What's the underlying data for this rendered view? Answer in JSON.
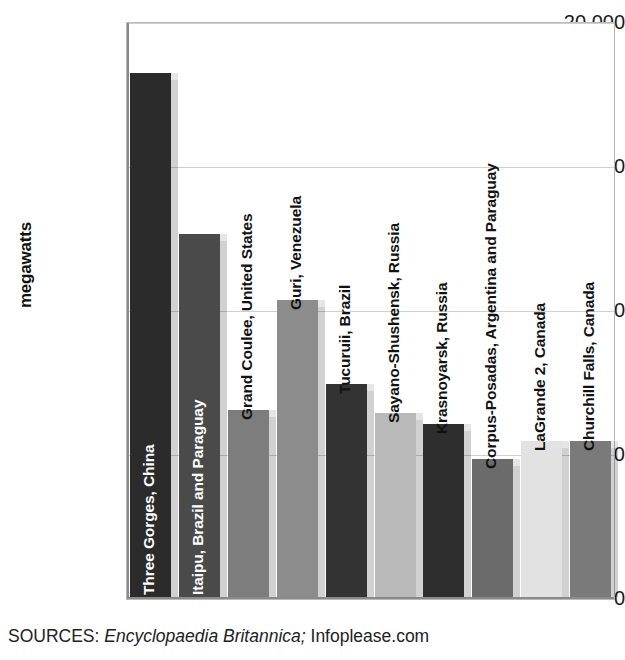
{
  "chart_data": {
    "type": "bar",
    "title": "",
    "xlabel": "",
    "ylabel": "megawatts",
    "ylim": [
      0,
      20000
    ],
    "yticks": [
      0,
      5000,
      10000,
      15000,
      20000
    ],
    "ytick_labels": [
      "0",
      "5,000",
      "10,000",
      "15,000",
      "20,000"
    ],
    "grid": true,
    "legend": "none",
    "categories": [
      "Three Gorges, China",
      "Itaipu, Brazil and Paraguay",
      "Grand Coulee, United States",
      "Guri, Venezuela",
      "Tucuruii, Brazil",
      "Sayano-Shushensk, Russia",
      "Krasnoyarsk, Russia",
      "Corpus-Posadas, Argentina and Paraguay",
      "LaGrande 2, Canada",
      "Churchill Falls, Canada"
    ],
    "values": [
      18200,
      12600,
      6500,
      10300,
      7400,
      6400,
      6000,
      4800,
      5400,
      5400
    ],
    "bar_colors": [
      "#2b2b2b",
      "#4a4a4a",
      "#7d7d7d",
      "#8c8c8c",
      "#333333",
      "#b9b9b9",
      "#2e2e2e",
      "#6b6b6b",
      "#e2e2e2",
      "#7a7a7a"
    ],
    "label_colors": [
      "#ffffff",
      "#ffffff",
      "#111111",
      "#111111",
      "#111111",
      "#111111",
      "#111111",
      "#111111",
      "#111111",
      "#111111"
    ]
  },
  "source": {
    "prefix": "SOURCES: ",
    "italic": "Encyclopaedia Britannica;",
    "suffix": " Infoplease.com"
  }
}
